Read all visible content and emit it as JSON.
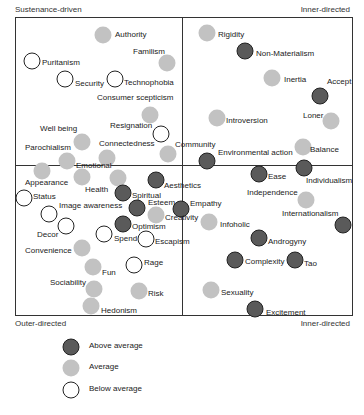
{
  "chart_data": {
    "type": "scatter",
    "title": "",
    "quadrant_labels": {
      "top_left": "Sustenance-driven",
      "top_right": "Inner-directed",
      "bottom_left": "Outer-directed",
      "bottom_right": "Inner-directed"
    },
    "legend": [
      {
        "key": "above",
        "label": "Above average"
      },
      {
        "key": "avg",
        "label": "Average"
      },
      {
        "key": "below",
        "label": "Below average"
      }
    ],
    "grid": false,
    "points": [
      {
        "name": "Authority",
        "cat": "avg",
        "x": 103,
        "y": 35,
        "lx": 115,
        "ly": 35
      },
      {
        "name": "Familism",
        "cat": "avg",
        "x": 167,
        "y": 63,
        "lx": 133,
        "ly": 52
      },
      {
        "name": "Puritanism",
        "cat": "below",
        "x": 32,
        "y": 61,
        "lx": 42,
        "ly": 63
      },
      {
        "name": "Security",
        "cat": "below",
        "x": 65,
        "y": 79,
        "lx": 75,
        "ly": 84
      },
      {
        "name": "Technophobia",
        "cat": "below",
        "x": 115,
        "y": 79,
        "lx": 124,
        "ly": 83
      },
      {
        "name": "Consumer scepticism",
        "cat": "avg",
        "x": 150,
        "y": 115,
        "lx": 97,
        "ly": 98
      },
      {
        "name": "Resignation",
        "cat": "below",
        "x": 161,
        "y": 134,
        "lx": 110,
        "ly": 126
      },
      {
        "name": "Well being",
        "cat": "avg",
        "x": 82,
        "y": 142,
        "lx": 40,
        "ly": 129
      },
      {
        "name": "Parochialism",
        "cat": "avg",
        "x": 67,
        "y": 161,
        "lx": 25,
        "ly": 148
      },
      {
        "name": "Connectedness",
        "cat": "avg",
        "x": 107,
        "y": 158,
        "lx": 99,
        "ly": 144
      },
      {
        "name": "Community",
        "cat": "avg",
        "x": 168,
        "y": 154,
        "lx": 175,
        "ly": 145
      },
      {
        "name": "Rigidity",
        "cat": "avg",
        "x": 207,
        "y": 33,
        "lx": 218,
        "ly": 35
      },
      {
        "name": "Non-Materialism",
        "cat": "above",
        "x": 245,
        "y": 51,
        "lx": 256,
        "ly": 54
      },
      {
        "name": "Inertia",
        "cat": "avg",
        "x": 272,
        "y": 78,
        "lx": 284,
        "ly": 80
      },
      {
        "name": "Accept",
        "cat": "above",
        "x": 320,
        "y": 96,
        "lx": 327,
        "ly": 82
      },
      {
        "name": "Introversion",
        "cat": "avg",
        "x": 217,
        "y": 118,
        "lx": 226,
        "ly": 121
      },
      {
        "name": "Loner",
        "cat": "avg",
        "x": 331,
        "y": 121,
        "lx": 303,
        "ly": 116
      },
      {
        "name": "Balance",
        "cat": "avg",
        "x": 303,
        "y": 147,
        "lx": 310,
        "ly": 150
      },
      {
        "name": "Environmental action",
        "cat": "above",
        "x": 207,
        "y": 161,
        "lx": 218,
        "ly": 153
      },
      {
        "name": "Ease",
        "cat": "above",
        "x": 259,
        "y": 174,
        "lx": 268,
        "ly": 177
      },
      {
        "name": "Individualism",
        "cat": "above",
        "x": 304,
        "y": 168,
        "lx": 306,
        "ly": 181
      },
      {
        "name": "Independence",
        "cat": "avg",
        "x": 306,
        "y": 200,
        "lx": 247,
        "ly": 193
      },
      {
        "name": "Internationalism",
        "cat": "above",
        "x": 343,
        "y": 225,
        "lx": 282,
        "ly": 214
      },
      {
        "name": "Empathy",
        "cat": "above",
        "x": 181,
        "y": 209,
        "lx": 190,
        "ly": 204
      },
      {
        "name": "Infoholic",
        "cat": "avg",
        "x": 209,
        "y": 222,
        "lx": 220,
        "ly": 225
      },
      {
        "name": "Androgyny",
        "cat": "above",
        "x": 259,
        "y": 238,
        "lx": 268,
        "ly": 242
      },
      {
        "name": "Complexity",
        "cat": "above",
        "x": 235,
        "y": 260,
        "lx": 245,
        "ly": 262
      },
      {
        "name": "Tao",
        "cat": "above",
        "x": 295,
        "y": 260,
        "lx": 304,
        "ly": 264
      },
      {
        "name": "Sexuality",
        "cat": "avg",
        "x": 211,
        "y": 290,
        "lx": 221,
        "ly": 293
      },
      {
        "name": "Excitement",
        "cat": "above",
        "x": 255,
        "y": 309,
        "lx": 266,
        "ly": 313
      },
      {
        "name": "Emotional",
        "cat": "avg",
        "x": 118,
        "y": 178,
        "lx": 76,
        "ly": 166
      },
      {
        "name": "Appearance",
        "cat": "avg",
        "x": 42,
        "y": 171,
        "lx": 25,
        "ly": 183
      },
      {
        "name": "Status",
        "cat": "below",
        "x": 24,
        "y": 198,
        "lx": 33,
        "ly": 197
      },
      {
        "name": "Health",
        "cat": "avg",
        "x": 82,
        "y": 177,
        "lx": 85,
        "ly": 190
      },
      {
        "name": "Aesthetics",
        "cat": "above",
        "x": 156,
        "y": 180,
        "lx": 164,
        "ly": 186
      },
      {
        "name": "Spiritual",
        "cat": "above",
        "x": 123,
        "y": 193,
        "lx": 132,
        "ly": 196
      },
      {
        "name": "Image awareness",
        "cat": "below",
        "x": 49,
        "y": 214,
        "lx": 59,
        "ly": 206
      },
      {
        "name": "Esteem",
        "cat": "above",
        "x": 137,
        "y": 208,
        "lx": 148,
        "ly": 203
      },
      {
        "name": "Creativity",
        "cat": "avg",
        "x": 156,
        "y": 215,
        "lx": 165,
        "ly": 218
      },
      {
        "name": "Optimism",
        "cat": "above",
        "x": 123,
        "y": 224,
        "lx": 132,
        "ly": 227
      },
      {
        "name": "Decor",
        "cat": "below",
        "x": 66,
        "y": 226,
        "lx": 37,
        "ly": 235
      },
      {
        "name": "Spend",
        "cat": "below",
        "x": 104,
        "y": 234,
        "lx": 114,
        "ly": 239
      },
      {
        "name": "Escapism",
        "cat": "below",
        "x": 146,
        "y": 239,
        "lx": 155,
        "ly": 242
      },
      {
        "name": "Convenience",
        "cat": "avg",
        "x": 82,
        "y": 248,
        "lx": 25,
        "ly": 251
      },
      {
        "name": "Rage",
        "cat": "below",
        "x": 134,
        "y": 265,
        "lx": 144,
        "ly": 263
      },
      {
        "name": "Fun",
        "cat": "avg",
        "x": 93,
        "y": 267,
        "lx": 102,
        "ly": 273
      },
      {
        "name": "Sociability",
        "cat": "avg",
        "x": 94,
        "y": 289,
        "lx": 50,
        "ly": 283
      },
      {
        "name": "Risk",
        "cat": "avg",
        "x": 139,
        "y": 291,
        "lx": 148,
        "ly": 294
      },
      {
        "name": "Hedonism",
        "cat": "avg",
        "x": 91,
        "y": 306,
        "lx": 101,
        "ly": 311
      }
    ]
  }
}
